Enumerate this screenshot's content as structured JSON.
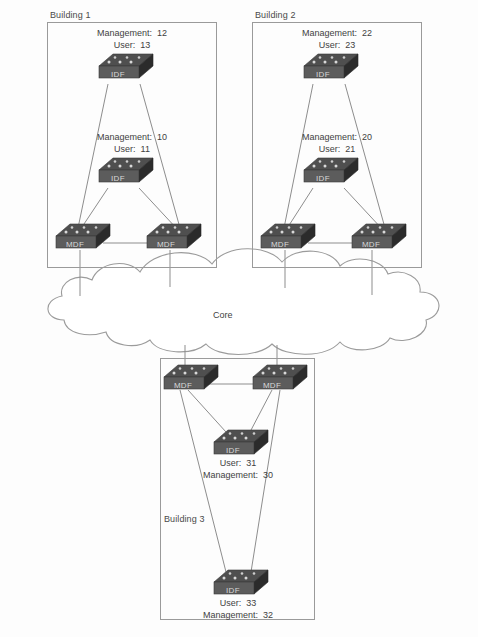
{
  "diagram": {
    "core": {
      "label": "Core",
      "shape": "cloud"
    },
    "buildings": [
      {
        "id": "building-1",
        "label": "Building 1",
        "label_position": "above-box",
        "nodes": [
          {
            "id": "b1-idf-top",
            "type": "IDF",
            "label": "IDF",
            "annotation_position": "above",
            "lines": [
              "Management:  12",
              "User:  13"
            ],
            "management_vlan": 12,
            "user_vlan": 13
          },
          {
            "id": "b1-idf-mid",
            "type": "IDF",
            "label": "IDF",
            "annotation_position": "above",
            "lines": [
              "Management:  10",
              "User:  11"
            ],
            "management_vlan": 10,
            "user_vlan": 11
          },
          {
            "id": "b1-mdf-left",
            "type": "MDF",
            "label": "MDF"
          },
          {
            "id": "b1-mdf-right",
            "type": "MDF",
            "label": "MDF"
          }
        ]
      },
      {
        "id": "building-2",
        "label": "Building 2",
        "label_position": "above-box",
        "nodes": [
          {
            "id": "b2-idf-top",
            "type": "IDF",
            "label": "IDF",
            "annotation_position": "above",
            "lines": [
              "Management:  22",
              "User:  23"
            ],
            "management_vlan": 22,
            "user_vlan": 23
          },
          {
            "id": "b2-idf-mid",
            "type": "IDF",
            "label": "IDF",
            "annotation_position": "above",
            "lines": [
              "Management:  20",
              "User:  21"
            ],
            "management_vlan": 20,
            "user_vlan": 21
          },
          {
            "id": "b2-mdf-left",
            "type": "MDF",
            "label": "MDF"
          },
          {
            "id": "b2-mdf-right",
            "type": "MDF",
            "label": "MDF"
          }
        ]
      },
      {
        "id": "building-3",
        "label": "Building 3",
        "label_position": "inside-box",
        "nodes": [
          {
            "id": "b3-mdf-left",
            "type": "MDF",
            "label": "MDF"
          },
          {
            "id": "b3-mdf-right",
            "type": "MDF",
            "label": "MDF"
          },
          {
            "id": "b3-idf-mid",
            "type": "IDF",
            "label": "IDF",
            "annotation_position": "below",
            "lines": [
              "User:  31",
              "Management:  30"
            ],
            "management_vlan": 30,
            "user_vlan": 31
          },
          {
            "id": "b3-idf-bottom",
            "type": "IDF",
            "label": "IDF",
            "annotation_position": "below",
            "lines": [
              "User:  33",
              "Management:  32"
            ],
            "management_vlan": 32,
            "user_vlan": 33
          }
        ]
      }
    ],
    "colors": {
      "switch_top": "#4f4f4f",
      "switch_front": "#5a5a5a",
      "switch_side": "#2e2e2e",
      "switch_text": "#d8d8d8",
      "line": "#8d8d8d",
      "box_border": "#9a9a9a",
      "text": "#3f3f3f",
      "background": "#fdfdfd"
    }
  }
}
